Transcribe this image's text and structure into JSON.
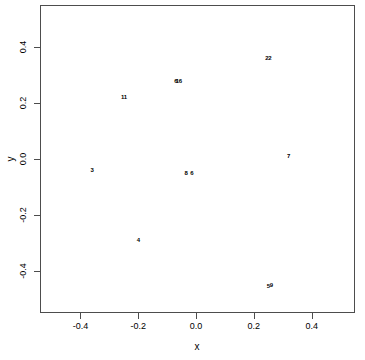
{
  "chart_data": {
    "type": "scatter",
    "title": "",
    "xlabel": "x",
    "ylabel": "y",
    "xlim": [
      -0.54,
      0.55
    ],
    "ylim": [
      -0.55,
      0.55
    ],
    "xticks": [
      -0.4,
      -0.2,
      0.0,
      0.2,
      0.4
    ],
    "xticklabels": [
      "-0.4",
      "-0.2",
      "0.0",
      "0.2",
      "0.4"
    ],
    "yticks": [
      0.4,
      0.2,
      0.0,
      -0.2,
      -0.4
    ],
    "yticklabels": [
      "0.4",
      "0.2",
      "0.0",
      "-0.2",
      "-0.4"
    ],
    "grid": false,
    "legend": null,
    "marker": "text-label",
    "point_color": "#000000",
    "frame_color": "#4d4d4d",
    "background": "#ffffff",
    "points": [
      {
        "label": "22",
        "x": 0.25,
        "y": 0.36
      },
      {
        "label": "6",
        "x": -0.07,
        "y": 0.28
      },
      {
        "label": "16",
        "x": -0.06,
        "y": 0.28
      },
      {
        "label": "11",
        "x": -0.25,
        "y": 0.22
      },
      {
        "label": "3",
        "x": -0.36,
        "y": -0.04
      },
      {
        "label": "8",
        "x": -0.035,
        "y": -0.05
      },
      {
        "label": "6",
        "x": -0.015,
        "y": -0.05
      },
      {
        "label": "7",
        "x": 0.32,
        "y": 0.01
      },
      {
        "label": "4",
        "x": -0.2,
        "y": -0.29
      },
      {
        "label": "5",
        "x": 0.25,
        "y": -0.455
      },
      {
        "label": "9",
        "x": 0.26,
        "y": -0.45
      }
    ]
  },
  "axes": {
    "x": {
      "title": "x",
      "ticks": [
        {
          "label": "-0.4",
          "value": -0.4
        },
        {
          "label": "-0.2",
          "value": -0.2
        },
        {
          "label": "0.0",
          "value": 0.0
        },
        {
          "label": "0.2",
          "value": 0.2
        },
        {
          "label": "0.4",
          "value": 0.4
        }
      ]
    },
    "y": {
      "title": "y",
      "ticks": [
        {
          "label": "0.4",
          "value": 0.4
        },
        {
          "label": "0.2",
          "value": 0.2
        },
        {
          "label": "0.0",
          "value": 0.0
        },
        {
          "label": "-0.2",
          "value": -0.2
        },
        {
          "label": "-0.4",
          "value": -0.4
        }
      ]
    }
  }
}
